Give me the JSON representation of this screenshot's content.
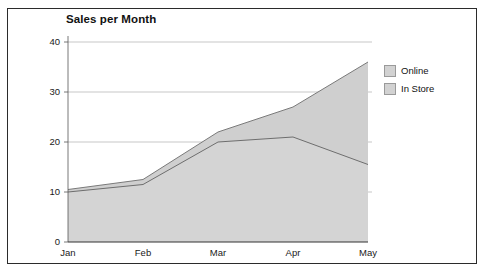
{
  "frame": {
    "border_color": "#2b2b2b"
  },
  "chart_data": {
    "type": "area",
    "stacked": true,
    "title": "Sales per Month",
    "xlabel": "",
    "ylabel": "",
    "categories": [
      "Jan",
      "Feb",
      "Mar",
      "Apr",
      "May"
    ],
    "xticklabels": [
      "Jan",
      "Feb",
      "Mar",
      "Apr",
      "May"
    ],
    "yticklabels": [
      "0",
      "10",
      "20",
      "30",
      "40"
    ],
    "yticks": [
      0,
      10,
      20,
      30,
      40
    ],
    "ylim": [
      0,
      40
    ],
    "grid": true,
    "grid_axis": "y",
    "legend_position": "right",
    "series": [
      {
        "name": "In Store",
        "values": [
          10,
          11.5,
          20,
          21,
          15.5
        ],
        "fill_color": "#d4d4d4",
        "line_color": "#6e6e6e",
        "stack_order": 1
      },
      {
        "name": "Online",
        "values": [
          0.5,
          1,
          2,
          6,
          20.5
        ],
        "cumulative_top": [
          10.5,
          12.5,
          22,
          27,
          36
        ],
        "fill_color": "#cfcfcf",
        "line_color": "#7a7a7a",
        "stack_order": 2
      }
    ]
  },
  "legend": {
    "items": [
      {
        "label": "Online",
        "swatch_color": "#d2d2d2"
      },
      {
        "label": "In Store",
        "swatch_color": "#d2d2d2"
      }
    ]
  }
}
